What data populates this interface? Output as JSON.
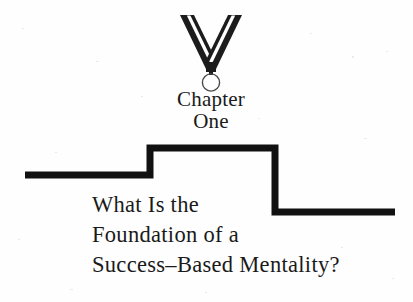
{
  "page": {
    "background_color": "#fefefe",
    "ink_color": "#1a1a1a",
    "width": 413,
    "height": 302
  },
  "medal": {
    "icon_name": "medal-ribbon-icon",
    "ribbon_color": "#1c1c1c",
    "ribbon_gap_color": "#ffffff",
    "medallion_shape": "ring",
    "medallion_outline_color": "#4a4a4a"
  },
  "chapter_label": {
    "lines": [
      "Chapter",
      "One"
    ]
  },
  "step_graphic": {
    "icon_name": "step-chart-line",
    "stroke_color": "#111111",
    "stroke_width": 7,
    "points": "25,43 150,43 150,16 275,16 275,80 395,80"
  },
  "chapter_title": {
    "lines": [
      "What Is the",
      "Foundation of a",
      "Success–Based Mentality?"
    ]
  }
}
